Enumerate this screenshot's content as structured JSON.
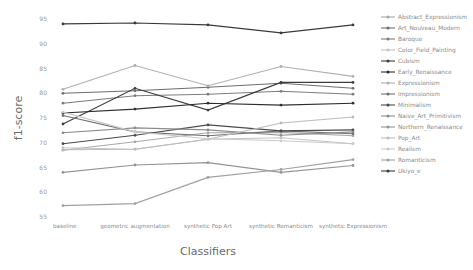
{
  "chart_data": {
    "type": "line",
    "title": "",
    "xlabel": "Classifiers",
    "ylabel": "f1-score",
    "ylim": [
      55,
      95
    ],
    "yticks": [
      55,
      60,
      65,
      70,
      75,
      80,
      85,
      90,
      95
    ],
    "grid": false,
    "legend_position": "right",
    "categories": [
      "baseline",
      "geometric augmentation",
      "synthetic Pop Art",
      "synthetic Romanticism",
      "synthetic Expressionism"
    ],
    "series": [
      {
        "name": "Abstract_Expressionism",
        "color": "#a8a8a8",
        "values": [
          68.5,
          70.2,
          72.0,
          72.1,
          71.4
        ]
      },
      {
        "name": "Art_Nouveau_Modern",
        "color": "#6e6e6e",
        "values": [
          80.0,
          80.5,
          81.2,
          82.0,
          81.0
        ]
      },
      {
        "name": "Baroque",
        "color": "#7d7d7d",
        "values": [
          78.0,
          79.5,
          79.8,
          80.4,
          79.8
        ]
      },
      {
        "name": "Color_Field_Painting",
        "color": "#c4c4c4",
        "values": [
          69.0,
          68.7,
          70.7,
          71.0,
          69.8
        ]
      },
      {
        "name": "Cubism",
        "color": "#3c3c3c",
        "values": [
          73.8,
          81.0,
          76.6,
          82.2,
          82.2
        ]
      },
      {
        "name": "Early_Renaissance",
        "color": "#2e2e2e",
        "values": [
          76.0,
          76.8,
          78.0,
          77.6,
          78.0
        ]
      },
      {
        "name": "Expressionism",
        "color": "#b0b0b0",
        "values": [
          80.8,
          85.6,
          81.5,
          85.4,
          83.4
        ]
      },
      {
        "name": "Impressionism",
        "color": "#727272",
        "values": [
          75.5,
          72.2,
          71.4,
          72.4,
          71.8
        ]
      },
      {
        "name": "Minimalism",
        "color": "#4a4a4a",
        "values": [
          69.8,
          71.5,
          73.6,
          72.4,
          72.6
        ]
      },
      {
        "name": "Naive_Art_Primitivism",
        "color": "#8c8c8c",
        "values": [
          72.0,
          73.0,
          72.6,
          71.5,
          72.2
        ]
      },
      {
        "name": "Northern_Renaissance",
        "color": "#949494",
        "values": [
          64.0,
          65.5,
          66.0,
          64.0,
          65.4
        ]
      },
      {
        "name": "Pop_Art",
        "color": "#bcbcbc",
        "values": [
          68.6,
          68.7,
          70.7,
          74.0,
          75.2
        ]
      },
      {
        "name": "Realism",
        "color": "#cacaca",
        "values": [
          76.2,
          72.2,
          70.8,
          70.4,
          69.8
        ]
      },
      {
        "name": "Romanticism",
        "color": "#a0a0a0",
        "values": [
          57.3,
          57.7,
          63.0,
          64.6,
          66.6
        ]
      },
      {
        "name": "Ukiyo_e",
        "color": "#3a3a3a",
        "values": [
          94.0,
          94.2,
          93.8,
          92.2,
          93.8
        ]
      }
    ]
  }
}
